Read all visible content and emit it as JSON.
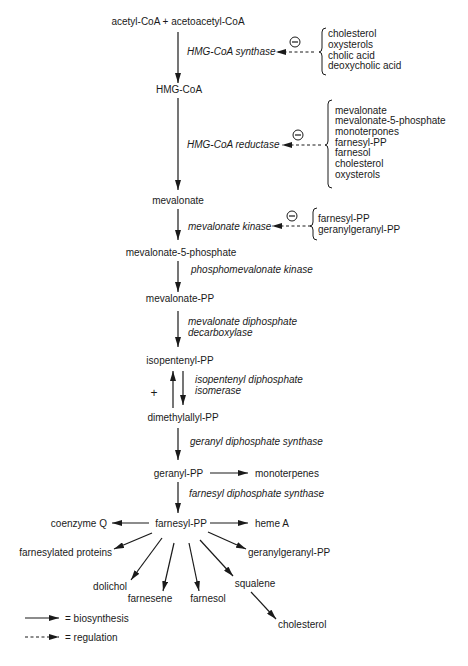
{
  "diagram": {
    "pathway": {
      "substrates": "acetyl-CoA + acetoacetyl-CoA",
      "hmg_coa": "HMG-CoA",
      "mevalonate": "mevalonate",
      "mevalonate_5_phosphate": "mevalonate-5-phosphate",
      "mevalonate_pp": "mevalonate-PP",
      "isopentenyl_pp": "isopentenyl-PP",
      "dimethylallyl_pp": "dimethylallyl-PP",
      "geranyl_pp": "geranyl-PP",
      "farnesyl_pp": "farnesyl-PP"
    },
    "enzymes": {
      "hmg_coa_synthase": "HMG-CoA synthase",
      "hmg_coa_reductase": "HMG-CoA reductase",
      "mevalonate_kinase": "mevalonate kinase",
      "phosphomevalonate_kinase": "phosphomevalonate kinase",
      "mevalonate_diphosphate_decarboxylase": [
        "mevalonate diphosphate",
        "decarboxylase"
      ],
      "isopentenyl_diphosphate_isomerase": [
        "isopentenyl diphosphate",
        "isomerase"
      ],
      "geranyl_diphosphate_synthase": "geranyl diphosphate synthase",
      "farnesyl_diphosphate_synthase": "farnesyl diphosphate synthase"
    },
    "regulators": {
      "hmg_coa_synthase": [
        "cholesterol",
        "oxysterols",
        "cholic acid",
        "deoxycholic acid"
      ],
      "hmg_coa_reductase": [
        "mevalonate",
        "mevalonate-5-phosphate",
        "monoterpones",
        "farnesyl-PP",
        "farnesol",
        "cholesterol",
        "oxysterols"
      ],
      "mevalonate_kinase": [
        "farnesyl-PP",
        "geranylgeranyl-PP"
      ]
    },
    "symbols": {
      "inhibition": "minus-circle",
      "activation": "+"
    },
    "branches": {
      "from_geranyl_pp": [
        "monoterpenes"
      ],
      "from_farnesyl_pp": {
        "coenzyme_q": "coenzyme Q",
        "heme_a": "heme A",
        "farnesylated_proteins": "farnesylated proteins",
        "geranylgeranyl_pp": "geranylgeranyl-PP",
        "dolichol": "dolichol",
        "farnesene": "farnesene",
        "farnesol": "farnesol",
        "squalene": "squalene"
      },
      "from_squalene": [
        "cholesterol"
      ]
    },
    "legend": [
      {
        "style": "solid",
        "label": "= biosynthesis"
      },
      {
        "style": "dashed",
        "label": "= regulation"
      }
    ]
  }
}
